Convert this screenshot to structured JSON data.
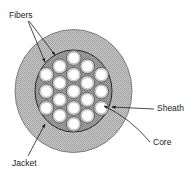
{
  "diagram": {
    "labels": {
      "fibers": "Fibers",
      "sheath": "Sheath",
      "core": "Core",
      "jacket": "Jacket"
    },
    "geometry": {
      "center": [
        74,
        91
      ],
      "jacket_outer_radius": 61,
      "sheath_radius": 39,
      "fiber_outer_radius": 7.4,
      "fiber_core_radius": 5.8
    },
    "fibers": [
      [
        73.7,
        58
      ],
      [
        59.7,
        66.3
      ],
      [
        87.3,
        66.3
      ],
      [
        46.3,
        74.7
      ],
      [
        73.7,
        74.7
      ],
      [
        101.3,
        74.7
      ],
      [
        59.7,
        83
      ],
      [
        87.3,
        83
      ],
      [
        46.3,
        91.3
      ],
      [
        73.7,
        91.3
      ],
      [
        101.3,
        91.3
      ],
      [
        59.7,
        99.7
      ],
      [
        87.3,
        99.7
      ],
      [
        46.3,
        108
      ],
      [
        73.7,
        108
      ],
      [
        101.3,
        108
      ],
      [
        59.7,
        115.7
      ],
      [
        87.3,
        115.7
      ],
      [
        73.7,
        124
      ]
    ],
    "fiber_count": 19,
    "colors": {
      "jacket_fill": "#b8b8b8",
      "sheath_fill": "#9a9a9a",
      "fiber_ring": "#5a5a5a",
      "fiber_core": "#ffffff",
      "line": "#222222"
    }
  }
}
